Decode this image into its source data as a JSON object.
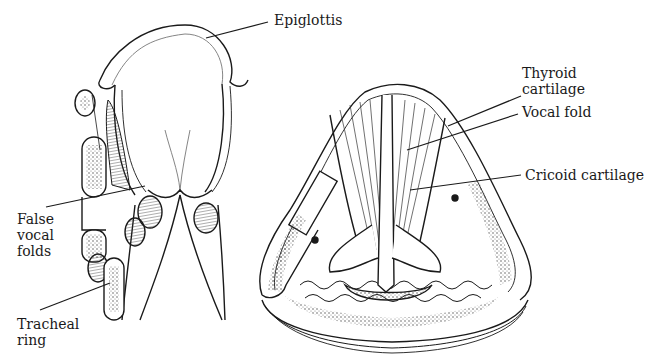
{
  "figure": {
    "type": "anatomical illustration",
    "colors": {
      "ink": "#1a1a1a",
      "background": "#ffffff",
      "stipple": "#555555"
    }
  },
  "left_view": {
    "labels": {
      "epiglottis": "Epiglottis",
      "false_vocal_folds": [
        "False",
        "vocal",
        "folds"
      ],
      "tracheal_ring": [
        "Tracheal",
        "ring"
      ]
    }
  },
  "right_view": {
    "labels": {
      "thyroid_cartilage": [
        "Thyroid",
        "cartilage"
      ],
      "vocal_fold": "Vocal fold",
      "cricoid_cartilage": "Cricoid cartilage"
    }
  }
}
